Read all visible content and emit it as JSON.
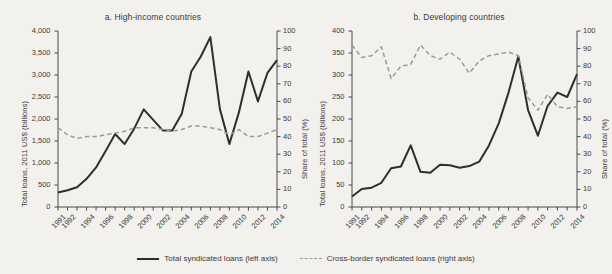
{
  "figure": {
    "background_color": "#f2f1ee",
    "text_color": "#3a3a3a",
    "series_colors": {
      "total": "#2e2e2e",
      "cross_border": "#9a9a9a"
    }
  },
  "legend": {
    "position": "bottom-center",
    "items": [
      {
        "label": "Total syndicated loans (left axis)",
        "style": "solid",
        "color": "#2e2e2e"
      },
      {
        "label": "Cross-border syndicated loans (right axis)",
        "style": "dashed",
        "color": "#9a9a9a"
      }
    ]
  },
  "chart_data": [
    {
      "type": "line",
      "id": "panel-a",
      "title": "a. High-income countries",
      "xlabel": "",
      "ylabel": "Total loans, 2011 US$ (billions)",
      "y2label": "Share of total (%)",
      "grid": false,
      "x": [
        1991,
        1992,
        1993,
        1994,
        1995,
        1996,
        1997,
        1998,
        1999,
        2000,
        2001,
        2002,
        2003,
        2004,
        2005,
        2006,
        2007,
        2008,
        2009,
        2010,
        2011,
        2012,
        2013,
        2014
      ],
      "xticks": [
        1991,
        1992,
        1994,
        1996,
        1998,
        2000,
        2002,
        2004,
        2006,
        2008,
        2010,
        2012,
        2014
      ],
      "ylim": [
        0,
        4000
      ],
      "yticks": [
        0,
        500,
        1000,
        1500,
        2000,
        2500,
        3000,
        3500,
        4000
      ],
      "ytick_labels": [
        "0",
        "500",
        "1,000",
        "1,500",
        "2,000",
        "2,500",
        "3,000",
        "3,500",
        "4,000"
      ],
      "y2lim": [
        0,
        100
      ],
      "y2ticks": [
        0,
        10,
        20,
        30,
        40,
        50,
        60,
        70,
        80,
        90,
        100
      ],
      "y2tick_labels": [
        "0",
        "10",
        "20",
        "30",
        "40",
        "50",
        "60",
        "70",
        "80",
        "90",
        "100"
      ],
      "series": [
        {
          "name": "Total syndicated loans (left axis)",
          "axis": "left",
          "style": "solid",
          "color": "#2e2e2e",
          "values": [
            330,
            380,
            450,
            640,
            900,
            1270,
            1660,
            1430,
            1780,
            2220,
            1980,
            1740,
            1740,
            2120,
            3080,
            3420,
            3860,
            2230,
            1430,
            2150,
            3080,
            2400,
            3050,
            3340
          ]
        },
        {
          "name": "Cross-border syndicated loans (right axis)",
          "axis": "right",
          "style": "dashed",
          "color": "#9a9a9a",
          "values": [
            45,
            41,
            39,
            40,
            40,
            41,
            42,
            43,
            45,
            45,
            45,
            44,
            43,
            44,
            46,
            46,
            45,
            44,
            41,
            44,
            40,
            40,
            42,
            44
          ]
        }
      ]
    },
    {
      "type": "line",
      "id": "panel-b",
      "title": "b. Developing countries",
      "xlabel": "",
      "ylabel": "Total loans, 2011 US$ (billions)",
      "y2label": "Share of total (%)",
      "grid": false,
      "x": [
        1991,
        1992,
        1993,
        1994,
        1995,
        1996,
        1997,
        1998,
        1999,
        2000,
        2001,
        2002,
        2003,
        2004,
        2005,
        2006,
        2007,
        2008,
        2009,
        2010,
        2011,
        2012,
        2013,
        2014
      ],
      "xticks": [
        1991,
        1992,
        1994,
        1996,
        1998,
        2000,
        2002,
        2004,
        2006,
        2008,
        2010,
        2012,
        2014
      ],
      "ylim": [
        0,
        400
      ],
      "yticks": [
        0,
        50,
        100,
        150,
        200,
        250,
        300,
        350,
        400
      ],
      "ytick_labels": [
        "0",
        "50",
        "100",
        "150",
        "200",
        "250",
        "300",
        "350",
        "400"
      ],
      "y2lim": [
        0,
        100
      ],
      "y2ticks": [
        0,
        10,
        20,
        30,
        40,
        50,
        60,
        70,
        80,
        90,
        100
      ],
      "y2tick_labels": [
        "0",
        "10",
        "20",
        "30",
        "40",
        "50",
        "60",
        "70",
        "80",
        "90",
        "100"
      ],
      "series": [
        {
          "name": "Total syndicated loans (left axis)",
          "axis": "left",
          "style": "solid",
          "color": "#2e2e2e",
          "values": [
            24,
            41,
            44,
            55,
            88,
            92,
            140,
            80,
            78,
            96,
            95,
            89,
            93,
            103,
            140,
            190,
            260,
            342,
            220,
            162,
            230,
            260,
            250,
            302
          ]
        },
        {
          "name": "Cross-border syndicated loans (right axis)",
          "axis": "right",
          "style": "dashed",
          "color": "#9a9a9a",
          "values": [
            92,
            85,
            86,
            91,
            73,
            80,
            81,
            92,
            86,
            84,
            88,
            84,
            76,
            83,
            86,
            87,
            88,
            86,
            62,
            55,
            64,
            57,
            56,
            57
          ]
        }
      ]
    }
  ]
}
